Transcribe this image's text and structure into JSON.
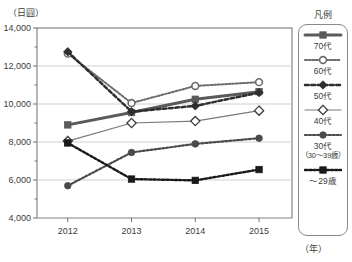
{
  "axis": {
    "y_unit_label": "（日圓）",
    "x_unit_label": "（年）"
  },
  "legend": {
    "title": "凡例"
  },
  "chart_data": {
    "type": "line",
    "title": "",
    "subtitle": "",
    "xlabel": "（年）",
    "ylabel": "（日圓）",
    "x": [
      "2012",
      "2013",
      "2014",
      "2015"
    ],
    "categories": [
      "2012",
      "2013",
      "2014",
      "2015"
    ],
    "ylim": [
      4000,
      14000
    ],
    "xlim": [
      "2012",
      "2015"
    ],
    "ytick_labels": [
      "14,000",
      "12,000",
      "10,000",
      "8,000",
      "6,000",
      "4,000"
    ],
    "ytick_values": [
      14000,
      12000,
      10000,
      8000,
      6000,
      4000
    ],
    "xtick_labels": [
      "2012",
      "2013",
      "2014",
      "2015"
    ],
    "grid": true,
    "grid_axis": "y",
    "legend_position": "right",
    "series": [
      {
        "name": "70代",
        "label": "70代",
        "values": [
          8900,
          9550,
          10250,
          10650
        ],
        "color": "#5a5a5a",
        "marker": "filled-square",
        "linestyle": "solid",
        "linewidth": 3
      },
      {
        "name": "60代",
        "label": "60代",
        "values": [
          12650,
          10050,
          10950,
          11150
        ],
        "color": "#6b6b6b",
        "marker": "open-circle",
        "linestyle": "dotted",
        "linewidth": 2
      },
      {
        "name": "50代",
        "label": "50代",
        "values": [
          12750,
          9600,
          9900,
          10600
        ],
        "color": "#2e2e2e",
        "marker": "filled-diamond",
        "linestyle": "dashed",
        "linewidth": 2.5
      },
      {
        "name": "40代",
        "label": "40代",
        "values": [
          8050,
          9000,
          9100,
          9650
        ],
        "color": "#7a7a7a",
        "marker": "open-diamond",
        "linestyle": "solid",
        "linewidth": 1.2
      },
      {
        "name": "30代",
        "label": "30代",
        "label_sub": "（30～39歳）",
        "values": [
          5700,
          7450,
          7900,
          8200
        ],
        "color": "#4a4a4a",
        "marker": "filled-circle",
        "linestyle": "dotted",
        "linewidth": 2.2
      },
      {
        "name": "～29歳",
        "label": "～29歳",
        "values": [
          7950,
          6050,
          5980,
          6550
        ],
        "color": "#1a1a1a",
        "marker": "filled-square",
        "linestyle": "dotted",
        "linewidth": 2.4
      }
    ]
  }
}
